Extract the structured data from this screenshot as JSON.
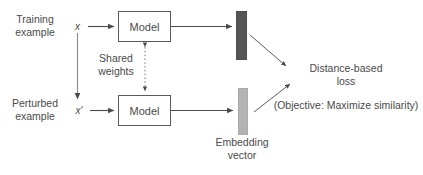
{
  "diagram": {
    "colors": {
      "stroke": "#5a5a5a",
      "text": "#4a4a4a",
      "embedding_dark": "#555555",
      "embedding_light": "#b3b3b3",
      "background": "#ffffff"
    },
    "labels": {
      "training_example": "Training\nexample",
      "perturbed_example": "Perturbed\nexample",
      "input_x": "x",
      "input_x_prime": "x′",
      "model_top": "Model",
      "model_bottom": "Model",
      "shared_weights": "Shared\nweights",
      "distance_loss": "Distance-based\nloss",
      "objective": "(Objective: Maximize similarity)",
      "embedding_vector": "Embedding\nvector"
    },
    "icons": {
      "arrow_x_to_model": "arrow-right-icon",
      "arrow_x_prime_to_model": "arrow-right-icon",
      "arrow_model_to_embedding_top": "arrow-right-icon",
      "arrow_model_to_embedding_bottom": "arrow-right-icon",
      "arrow_x_to_x_prime": "arrow-down-icon",
      "arrow_shared_weights": "dotted-double-arrow-vertical-icon",
      "arrow_embedding_top_to_loss": "arrow-diagonal-down-right-icon",
      "arrow_embedding_bottom_to_loss": "arrow-diagonal-up-right-icon"
    },
    "embedding_bars": [
      {
        "name": "embedding-vector-top",
        "shade": "dark"
      },
      {
        "name": "embedding-vector-bottom",
        "shade": "light"
      }
    ]
  }
}
